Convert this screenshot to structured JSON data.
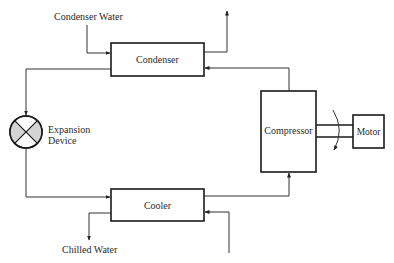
{
  "diagram": {
    "type": "refrigeration-cycle",
    "components": {
      "condenser": {
        "label": "Condenser"
      },
      "cooler": {
        "label": "Cooler"
      },
      "compressor": {
        "label": "Compressor"
      },
      "motor": {
        "label": "Motor"
      },
      "expansion_device": {
        "label_line1": "Expansion",
        "label_line2": "Device"
      }
    },
    "streams": {
      "condenser_water": {
        "label": "Condenser Water"
      },
      "chilled_water": {
        "label": "Chilled Water"
      }
    },
    "colors": {
      "line": "#333333",
      "box_border": "#1a1a1a",
      "valve_fill": "#d4d4d4",
      "text": "#2a2a2a"
    }
  }
}
